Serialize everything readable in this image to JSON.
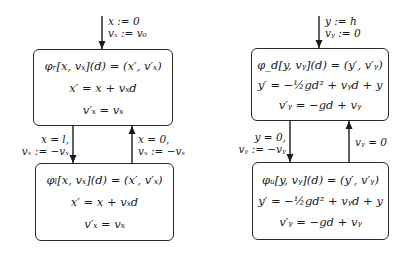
{
  "left_automaton": {
    "init_label": [
      "x := 0",
      "vₓ := v₀"
    ],
    "state_right": {
      "header": "φᵣ[x, vₓ](d) = (x′, v′ₓ)",
      "lines": [
        "x′ = x + vₓd",
        "v′ₓ = vₓ"
      ]
    },
    "state_left": {
      "header": "φₗ[x, vₓ](d) = (x′, v′ₓ)",
      "lines": [
        "x′ = x + vₓd",
        "v′ₓ = vₓ"
      ]
    },
    "transition_down": [
      "x = l,",
      "vₓ := −vₓ"
    ],
    "transition_up": [
      "x = 0,",
      "vₓ := −vₓ"
    ]
  },
  "right_automaton": {
    "init_label": [
      "y := h",
      "vᵧ := 0"
    ],
    "state_down": {
      "header": "φ_d[y, vᵧ](d) = (y′, v′ᵧ)",
      "lines": [
        "y′ = −½gd² + vᵧd + y",
        "v′ᵧ = −gd + vᵧ"
      ]
    },
    "state_up": {
      "header": "φᵤ[y, vᵧ](d) = (y′, v′ᵧ)",
      "lines": [
        "y′ = −½gd² + vᵧd + y",
        "v′ᵧ = −gd + vᵧ"
      ]
    },
    "transition_down": [
      "y = 0,",
      "vᵧ := −vᵧ"
    ],
    "transition_up": [
      "vᵧ = 0"
    ]
  }
}
